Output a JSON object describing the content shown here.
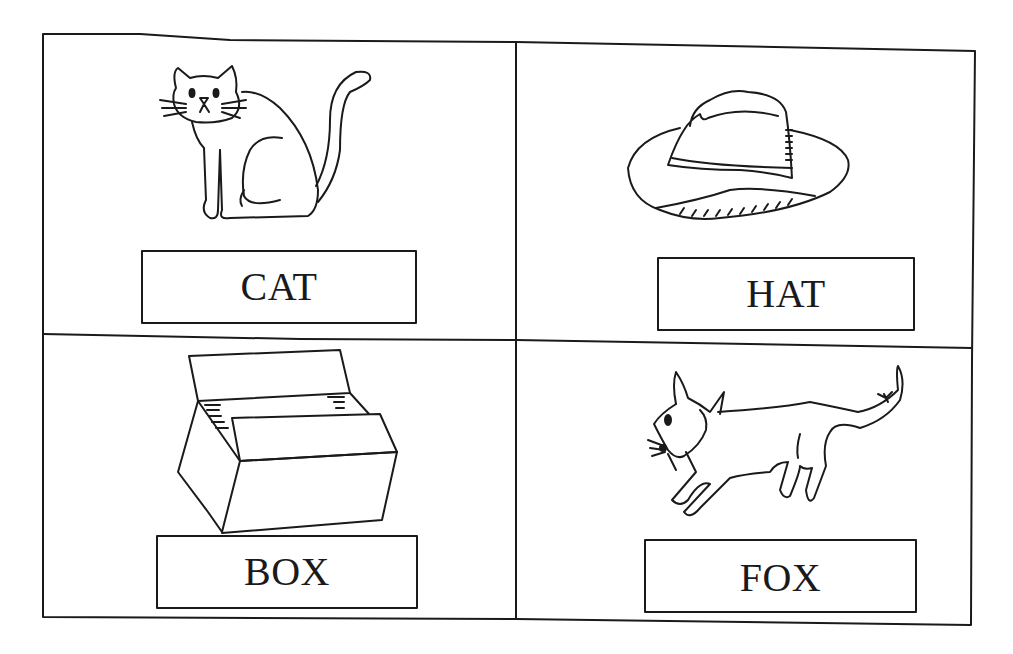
{
  "worksheet": {
    "cards": [
      {
        "word": "CAT",
        "picture": "cat"
      },
      {
        "word": "HAT",
        "picture": "hat"
      },
      {
        "word": "BOX",
        "picture": "box"
      },
      {
        "word": "FOX",
        "picture": "fox"
      }
    ]
  },
  "colors": {
    "ink": "#1a1a1a",
    "paper": "#ffffff"
  }
}
